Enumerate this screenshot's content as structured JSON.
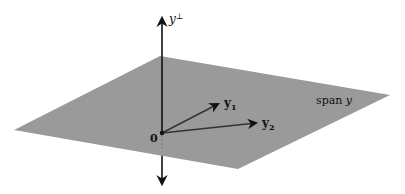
{
  "diagram": {
    "type": "orthogonal-complement-illustration",
    "plane": {
      "label": "span 𝒴",
      "label_prefix": "span",
      "label_symbol": "𝑦",
      "color": "#9a9a9a",
      "corners": [
        [
          160,
          56
        ],
        [
          390,
          95
        ],
        [
          238,
          169
        ],
        [
          14,
          130
        ]
      ]
    },
    "axis": {
      "label_base": "y",
      "label_sup": "⊥",
      "color": "#111111"
    },
    "origin": {
      "label": "0",
      "x": 162,
      "y": 133
    },
    "vectors": [
      {
        "label_base": "y",
        "label_sub": "1",
        "to": [
          220,
          103
        ]
      },
      {
        "label_base": "y",
        "label_sub": "2",
        "to": [
          258,
          123
        ]
      }
    ]
  }
}
